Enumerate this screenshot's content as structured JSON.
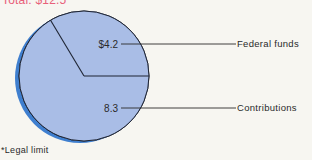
{
  "chart_data": {
    "type": "pie",
    "title": "Total: $12.5",
    "total": 12.5,
    "slices": [
      {
        "name": "Federal funds",
        "value": 4.2,
        "value_label": "$4.2"
      },
      {
        "name": "Contributions",
        "value": 8.3,
        "value_label": "8.3"
      }
    ],
    "legend": "right, leader lines",
    "footnote": "*Legal limit",
    "colors": {
      "fill": "#a9bde6",
      "edge": "#3f7fcf",
      "outline": "#1e2433",
      "title": "#e8607a",
      "text": "#2a2a2a"
    }
  }
}
